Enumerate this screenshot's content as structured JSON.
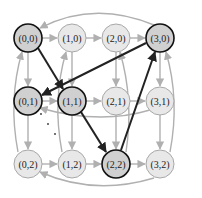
{
  "diagram": {
    "type": "directed-grid-graph",
    "colors": {
      "node_fill": "#e8e8e8",
      "node_stroke": "#a8a8a8",
      "highlight_fill": "#d0d0d0",
      "highlight_stroke": "#111111",
      "edge": "#b0b0b0",
      "highlight_edge": "#222222"
    },
    "nodes": [
      {
        "id": "0,0",
        "label": "(0,0)",
        "x": 28,
        "y": 38,
        "highlight": true
      },
      {
        "id": "1,0",
        "label": "(1,0)",
        "x": 72,
        "y": 38,
        "highlight": false
      },
      {
        "id": "2,0",
        "label": "(2,0)",
        "x": 116,
        "y": 38,
        "highlight": false
      },
      {
        "id": "3,0",
        "label": "(3,0)",
        "x": 160,
        "y": 38,
        "highlight": true
      },
      {
        "id": "0,1",
        "label": "(0,1)",
        "x": 28,
        "y": 101,
        "highlight": true
      },
      {
        "id": "1,1",
        "label": "(1,1)",
        "x": 72,
        "y": 101,
        "highlight": true
      },
      {
        "id": "2,1",
        "label": "(2,1)",
        "x": 116,
        "y": 101,
        "highlight": false
      },
      {
        "id": "3,1",
        "label": "(3,1)",
        "x": 160,
        "y": 101,
        "highlight": false
      },
      {
        "id": "0,2",
        "label": "(0,2)",
        "x": 28,
        "y": 164,
        "highlight": false
      },
      {
        "id": "1,2",
        "label": "(1,2)",
        "x": 72,
        "y": 164,
        "highlight": false
      },
      {
        "id": "2,2",
        "label": "(2,2)",
        "x": 116,
        "y": 164,
        "highlight": true
      },
      {
        "id": "3,2",
        "label": "(3,2)",
        "x": 160,
        "y": 164,
        "highlight": false
      }
    ],
    "highlight_path": [
      "0,0",
      "1,1",
      "2,2",
      "3,0",
      "0,1"
    ]
  }
}
